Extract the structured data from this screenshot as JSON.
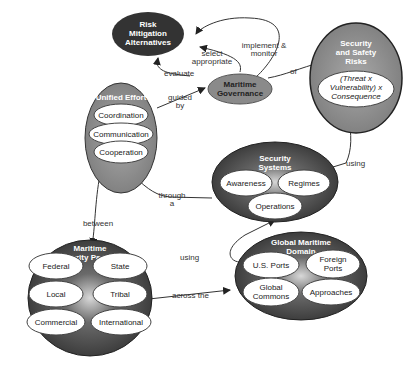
{
  "nodes": {
    "risk_mitigation": {
      "title": [
        "Risk",
        "Mitigation",
        "Alternatives"
      ]
    },
    "maritime_governance": {
      "title": [
        "Maritime",
        "Governance"
      ]
    },
    "security_risks": {
      "title": [
        "Security",
        "and Safety",
        "Risks"
      ],
      "formula": [
        "(Threat x",
        "Vulnerability) x",
        "Consequence"
      ]
    },
    "unified_effort": {
      "title": "Unified Effort",
      "items": [
        "Coordination",
        "Communication",
        "Cooperation"
      ]
    },
    "security_systems": {
      "title": [
        "Security",
        "Systems"
      ],
      "items": [
        "Awareness",
        "Regimes",
        "Operations"
      ]
    },
    "partners": {
      "title": [
        "Maritime",
        "Security Partners"
      ],
      "items": [
        "Federal",
        "State",
        "Local",
        "Tribal",
        "Commercial",
        "International"
      ]
    },
    "domain": {
      "title": [
        "Global Maritime",
        "Domain"
      ],
      "items": [
        "U.S. Ports",
        [
          "Foreign",
          "Ports"
        ],
        [
          "Global",
          "Commons"
        ],
        "Approaches"
      ]
    }
  },
  "links": {
    "evaluate": "evaluate",
    "select": [
      "select",
      "appropriate"
    ],
    "implement": [
      "implement &",
      "monitor"
    ],
    "of": "of",
    "guided": [
      "guided",
      "by"
    ],
    "using_risks": "using",
    "through": [
      "through",
      "a"
    ],
    "between": "between",
    "using_domain": "using",
    "across": "across the"
  },
  "colors": {
    "dark": "#3a3a3a",
    "mid": "#8a8a8a",
    "light": "#ffffff",
    "line": "#333333"
  }
}
